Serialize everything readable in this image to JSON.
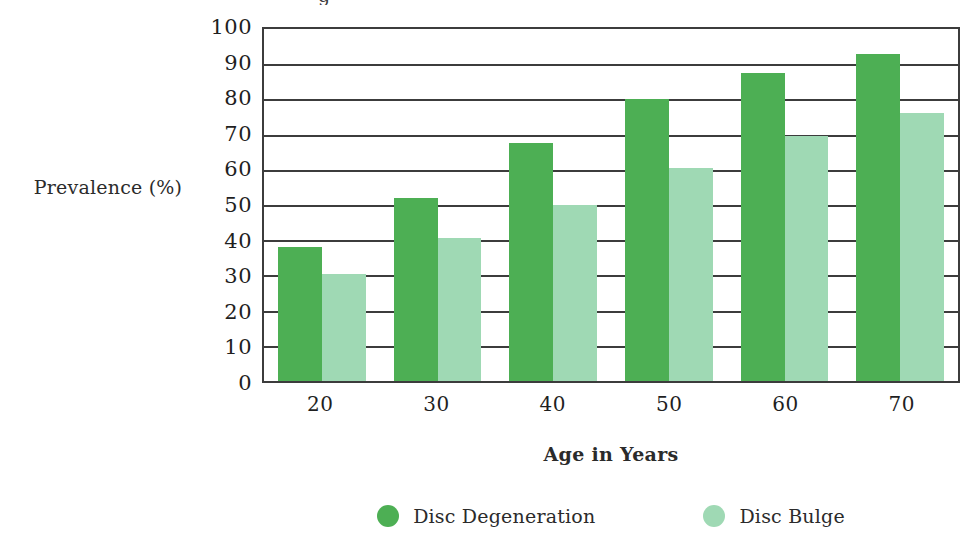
{
  "chart_data": {
    "type": "bar",
    "title": "",
    "xlabel": "Age in Years",
    "ylabel": "Prevalence (%)",
    "categories": [
      "20",
      "30",
      "40",
      "50",
      "60",
      "70"
    ],
    "series": [
      {
        "name": "Disc Degeneration",
        "color": "#4daf54",
        "values": [
          38,
          52,
          67.5,
          80,
          87.5,
          93
        ]
      },
      {
        "name": "Disc Bulge",
        "color": "#9fd9b4",
        "values": [
          30.5,
          40.5,
          50,
          60.5,
          69.5,
          76
        ]
      }
    ],
    "ylim": [
      0,
      100
    ],
    "y_ticks": [
      "0",
      "10",
      "20",
      "30",
      "40",
      "50",
      "60",
      "70",
      "80",
      "90",
      "100"
    ],
    "grid": "horizontal",
    "legend_position": "bottom"
  },
  "axes": {
    "y_title": "Prevalence (%)",
    "x_title": "Age in Years"
  },
  "legend": {
    "items": [
      {
        "label": "Disc Degeneration",
        "color": "#4daf54"
      },
      {
        "label": "Disc Bulge",
        "color": "#9fd9b4"
      }
    ]
  },
  "artifacts": {
    "cropped_title_fragment": "g"
  }
}
